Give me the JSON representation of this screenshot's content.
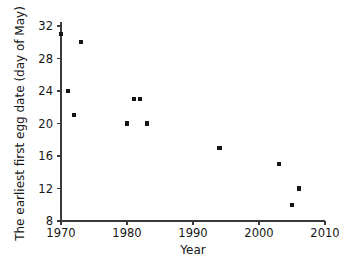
{
  "chart_data": {
    "type": "scatter",
    "title": "",
    "xlabel": "Year",
    "ylabel": "The earliest first egg date (day of May)",
    "xlim": [
      1970,
      2010
    ],
    "ylim": [
      8,
      32
    ],
    "xticks": [
      1970,
      1980,
      1990,
      2000,
      2010
    ],
    "yticks": [
      8,
      12,
      16,
      20,
      24,
      28,
      32
    ],
    "xtick_labels": [
      "1970",
      "1980",
      "1990",
      "2000",
      "2010"
    ],
    "ytick_labels": [
      "8",
      "12",
      "16",
      "20",
      "24",
      "28",
      "32"
    ],
    "grid": false,
    "legend": "none",
    "marker": "square",
    "marker_color": "#151515",
    "points": [
      {
        "x": 1970,
        "y": 31
      },
      {
        "x": 1971,
        "y": 24
      },
      {
        "x": 1972,
        "y": 21
      },
      {
        "x": 1973,
        "y": 30
      },
      {
        "x": 1980,
        "y": 20
      },
      {
        "x": 1981,
        "y": 23
      },
      {
        "x": 1982,
        "y": 23
      },
      {
        "x": 1983,
        "y": 20
      },
      {
        "x": 1994,
        "y": 17
      },
      {
        "x": 2003,
        "y": 15
      },
      {
        "x": 2005,
        "y": 10
      },
      {
        "x": 2006,
        "y": 12
      }
    ]
  }
}
